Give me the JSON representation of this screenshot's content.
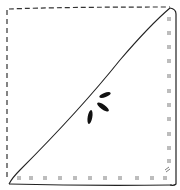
{
  "illustration": {
    "description": "hand-drawn folded napkin / fabric corner sketch",
    "colors": {
      "background": "#ffffff",
      "ink": "#2a2a2a"
    },
    "edges": {
      "top": "dashed",
      "left": "dashed",
      "right": "solid-stitched",
      "bottom": "solid-stitched",
      "diagonal": "solid"
    },
    "stitch_counts": {
      "bottom": 12,
      "right": 12
    },
    "seed_marks": 3
  }
}
